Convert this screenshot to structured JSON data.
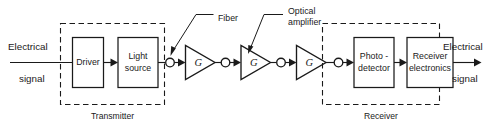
{
  "diagram": {
    "colors": {
      "ink": "#1a1a1a",
      "background": "#ffffff"
    },
    "input": {
      "line1": "Electrical",
      "line2": "signal"
    },
    "output": {
      "line1": "Electrical",
      "line2": "signal"
    },
    "transmitter": {
      "group_label": "Transmitter",
      "blocks": [
        {
          "label": "Driver",
          "line1": "Driver",
          "line2": ""
        },
        {
          "label": "Light source",
          "line1": "Light",
          "line2": "source"
        }
      ]
    },
    "link": {
      "amplifiers": [
        {
          "gain_label": "G"
        },
        {
          "gain_label": "G"
        },
        {
          "gain_label": "G"
        }
      ],
      "connector_count": 4
    },
    "receiver": {
      "group_label": "Receiver",
      "blocks": [
        {
          "label": "Photo-detector",
          "line1": "Photo -",
          "line2": "detector"
        },
        {
          "label": "Receiver electronics",
          "line1": "Receiver",
          "line2": "electronics"
        }
      ]
    },
    "callouts": [
      {
        "name": "fiber",
        "label": "Fiber",
        "line1": "Fiber",
        "line2": ""
      },
      {
        "name": "optical-amplifier",
        "label": "Optical amplifier",
        "line1": "Optical",
        "line2": "amplifier"
      }
    ]
  }
}
